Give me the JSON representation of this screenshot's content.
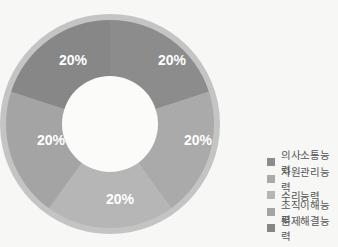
{
  "chart_data": {
    "type": "pie",
    "subtype": "donut",
    "title": "",
    "categories": [
      "의사소통능력",
      "자원관리능력",
      "수리능력",
      "조직이해능력",
      "문제해결능력"
    ],
    "values": [
      20,
      20,
      20,
      20,
      20
    ],
    "value_labels": [
      "20%",
      "20%",
      "20%",
      "20%",
      "20%"
    ],
    "colors": [
      "#8c8c8c",
      "#aaaaaa",
      "#b6b6b6",
      "#a4a4a4",
      "#878787"
    ],
    "start_angle_deg": 0,
    "direction": "clockwise",
    "legend_position": "right-bottom"
  },
  "legend": {
    "items": [
      {
        "label": "의사소통능력",
        "color": "#8c8c8c"
      },
      {
        "label": "자원관리능력",
        "color": "#aaaaaa"
      },
      {
        "label": "수리능력",
        "color": "#b6b6b6"
      },
      {
        "label": "조직이해능력",
        "color": "#a4a4a4"
      },
      {
        "label": "문제해결능력",
        "color": "#878787"
      }
    ]
  },
  "slices": [
    {
      "label": "20%"
    },
    {
      "label": "20%"
    },
    {
      "label": "20%"
    },
    {
      "label": "20%"
    },
    {
      "label": "20%"
    }
  ]
}
